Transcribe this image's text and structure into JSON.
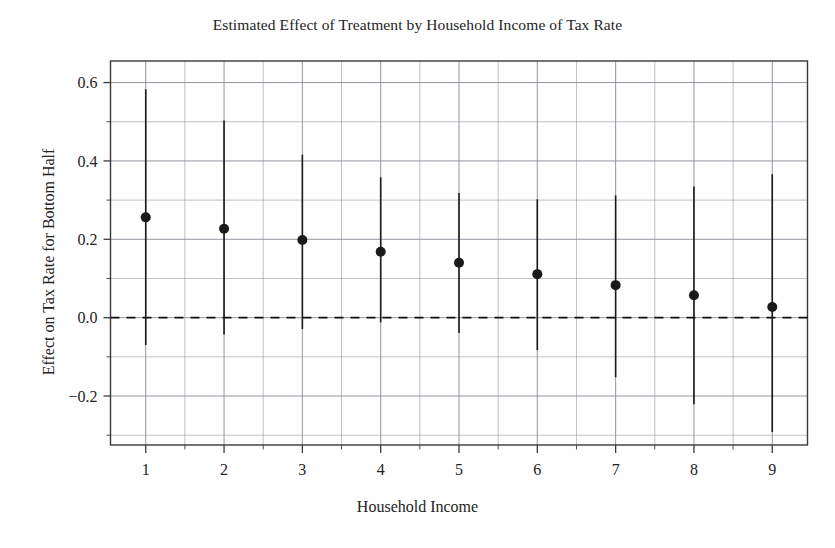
{
  "chart_data": {
    "type": "scatter",
    "title": "Estimated Effect of Treatment by Household Income of Tax Rate",
    "xlabel": "Household Income",
    "ylabel": "Effect on Tax Rate for Bottom Half",
    "grid": true,
    "legend": null,
    "xlim": [
      0.55,
      9.45
    ],
    "ylim": [
      -0.325,
      0.655
    ],
    "xticks": [
      1,
      2,
      3,
      4,
      5,
      6,
      7,
      8,
      9
    ],
    "xtick_labels": [
      "1",
      "2",
      "3",
      "4",
      "5",
      "6",
      "7",
      "8",
      "9"
    ],
    "yticks": [
      -0.2,
      0.0,
      0.2,
      0.4,
      0.6
    ],
    "ytick_labels": [
      "−0.2",
      "0.0",
      "0.2",
      "0.4",
      "0.6"
    ],
    "minor_yticks": [
      -0.3,
      -0.1,
      0.1,
      0.3,
      0.5
    ],
    "reference_line": {
      "y": 0.0,
      "style": "dashed",
      "color": "#111111"
    },
    "marker": {
      "shape": "circle",
      "color": "#1a1a1a",
      "size": 5
    },
    "errorbar": {
      "color": "#1a1a1a",
      "width": 1.6,
      "caps": false
    },
    "categories": [
      "1",
      "2",
      "3",
      "4",
      "5",
      "6",
      "7",
      "8",
      "9"
    ],
    "x": [
      1,
      2,
      3,
      4,
      5,
      6,
      7,
      8,
      9
    ],
    "values": [
      0.256,
      0.227,
      0.198,
      0.168,
      0.14,
      0.111,
      0.083,
      0.057,
      0.027
    ],
    "ci_low": [
      -0.07,
      -0.043,
      -0.029,
      -0.012,
      -0.039,
      -0.083,
      -0.152,
      -0.221,
      -0.292
    ],
    "ci_high": [
      0.583,
      0.503,
      0.416,
      0.358,
      0.318,
      0.302,
      0.312,
      0.335,
      0.366
    ],
    "series": [
      {
        "name": "Effect on Tax Rate for Bottom Half",
        "values": [
          0.256,
          0.227,
          0.198,
          0.168,
          0.14,
          0.111,
          0.083,
          0.057,
          0.027
        ],
        "ci_low": [
          -0.07,
          -0.043,
          -0.029,
          -0.012,
          -0.039,
          -0.083,
          -0.152,
          -0.221,
          -0.292
        ],
        "ci_high": [
          0.583,
          0.503,
          0.416,
          0.358,
          0.318,
          0.302,
          0.312,
          0.335,
          0.366
        ]
      }
    ]
  },
  "colors": {
    "background": "#fefefe",
    "axis": "#3a3a3a",
    "grid": "#8a8a96",
    "marker": "#1a1a1a",
    "text": "#242424"
  }
}
